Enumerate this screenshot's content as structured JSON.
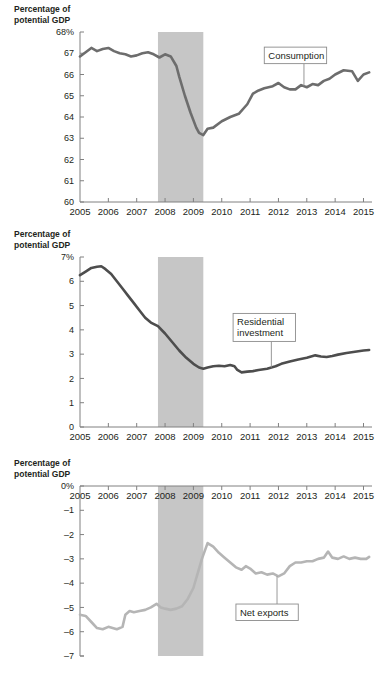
{
  "page": {
    "clipped_header": "Percentage of",
    "background": "#ffffff"
  },
  "colors": {
    "line_dark": "#6d6d6d",
    "line_light": "#b5b5b5",
    "recession_band": "#c6c6c6",
    "axis": "#808080",
    "text": "#231f20",
    "callout_border": "#8c8c8c"
  },
  "chart_data": [
    {
      "type": "line",
      "title": "",
      "id": "consumption",
      "ylabel": "Percentage of potential GDP",
      "xlabel": "",
      "legend_position": "inline-callout",
      "grid": false,
      "annotations": [
        {
          "label": "Consumption",
          "x": 2012.6,
          "y": 66.9,
          "anchor_x": 2012.9,
          "anchor_y": 65.45
        }
      ],
      "shaded_regions": [
        {
          "label": "recession",
          "x_start": 2007.75,
          "x_end": 2009.35
        }
      ],
      "xlim": [
        2005,
        2015.3
      ],
      "ylim": [
        60,
        68
      ],
      "ytick_labels": [
        "68%",
        "67",
        "66",
        "65",
        "64",
        "63",
        "62",
        "61",
        "60"
      ],
      "yticks": [
        68,
        67,
        66,
        65,
        64,
        63,
        62,
        61,
        60
      ],
      "xtick_labels": [
        "2005",
        "2006",
        "2007",
        "2008",
        "2009",
        "2010",
        "2011",
        "2012",
        "2013",
        "2014",
        "2015"
      ],
      "xticks": [
        2005,
        2006,
        2007,
        2008,
        2009,
        2010,
        2011,
        2012,
        2013,
        2014,
        2015
      ],
      "series": [
        {
          "name": "Consumption",
          "color": "#6d6d6d",
          "x": [
            2005.0,
            2005.2,
            2005.4,
            2005.6,
            2005.8,
            2006.0,
            2006.2,
            2006.4,
            2006.6,
            2006.8,
            2007.0,
            2007.2,
            2007.4,
            2007.6,
            2007.8,
            2008.0,
            2008.2,
            2008.4,
            2008.5,
            2008.7,
            2008.9,
            2009.1,
            2009.2,
            2009.35,
            2009.5,
            2009.7,
            2010.0,
            2010.3,
            2010.6,
            2010.9,
            2011.1,
            2011.3,
            2011.5,
            2011.8,
            2012.0,
            2012.2,
            2012.4,
            2012.6,
            2012.8,
            2013.0,
            2013.2,
            2013.4,
            2013.6,
            2013.8,
            2014.0,
            2014.3,
            2014.6,
            2014.8,
            2015.0,
            2015.2
          ],
          "y": [
            66.85,
            67.05,
            67.25,
            67.1,
            67.2,
            67.25,
            67.1,
            67.0,
            66.95,
            66.85,
            66.9,
            67.0,
            67.05,
            66.95,
            66.8,
            66.95,
            66.85,
            66.4,
            65.9,
            65.0,
            64.2,
            63.5,
            63.25,
            63.15,
            63.45,
            63.5,
            63.8,
            64.0,
            64.15,
            64.6,
            65.1,
            65.25,
            65.35,
            65.45,
            65.6,
            65.4,
            65.3,
            65.3,
            65.5,
            65.4,
            65.55,
            65.5,
            65.7,
            65.8,
            66.0,
            66.2,
            66.15,
            65.7,
            66.0,
            66.1
          ]
        }
      ]
    },
    {
      "type": "line",
      "title": "",
      "id": "residential-investment",
      "ylabel": "Percentage of potential GDP",
      "xlabel": "",
      "legend_position": "inline-callout",
      "grid": false,
      "annotations": [
        {
          "label": "Residential\ninvestment",
          "label_line1": "Residential",
          "label_line2": "investment",
          "x": 2011.5,
          "y": 4.1,
          "anchor_x": 2011.75,
          "anchor_y": 2.45
        }
      ],
      "shaded_regions": [
        {
          "label": "recession",
          "x_start": 2007.75,
          "x_end": 2009.35
        }
      ],
      "xlim": [
        2005,
        2015.3
      ],
      "ylim": [
        0,
        7
      ],
      "ytick_labels": [
        "7%",
        "6",
        "5",
        "4",
        "3",
        "2",
        "1",
        "0"
      ],
      "yticks": [
        7,
        6,
        5,
        4,
        3,
        2,
        1,
        0
      ],
      "xtick_labels": [
        "2005",
        "2006",
        "2007",
        "2008",
        "2009",
        "2010",
        "2011",
        "2012",
        "2013",
        "2014",
        "2015"
      ],
      "xticks": [
        2005,
        2006,
        2007,
        2008,
        2009,
        2010,
        2011,
        2012,
        2013,
        2014,
        2015
      ],
      "series": [
        {
          "name": "Residential investment",
          "color": "#4d4d4d",
          "x": [
            2005.0,
            2005.2,
            2005.4,
            2005.6,
            2005.75,
            2005.9,
            2006.1,
            2006.3,
            2006.5,
            2006.7,
            2006.9,
            2007.1,
            2007.3,
            2007.5,
            2007.75,
            2008.0,
            2008.25,
            2008.5,
            2008.75,
            2009.0,
            2009.2,
            2009.35,
            2009.5,
            2009.7,
            2009.9,
            2010.1,
            2010.3,
            2010.45,
            2010.55,
            2010.7,
            2010.9,
            2011.1,
            2011.3,
            2011.6,
            2011.9,
            2012.1,
            2012.4,
            2012.7,
            2013.0,
            2013.3,
            2013.5,
            2013.7,
            2013.9,
            2014.1,
            2014.4,
            2014.7,
            2015.0,
            2015.2
          ],
          "y": [
            6.25,
            6.4,
            6.55,
            6.6,
            6.62,
            6.5,
            6.3,
            6.0,
            5.7,
            5.4,
            5.1,
            4.8,
            4.5,
            4.3,
            4.15,
            3.85,
            3.5,
            3.15,
            2.85,
            2.6,
            2.45,
            2.4,
            2.45,
            2.5,
            2.52,
            2.5,
            2.55,
            2.5,
            2.35,
            2.25,
            2.28,
            2.3,
            2.35,
            2.4,
            2.5,
            2.6,
            2.7,
            2.78,
            2.85,
            2.95,
            2.9,
            2.88,
            2.92,
            2.98,
            3.05,
            3.1,
            3.15,
            3.17
          ]
        }
      ]
    },
    {
      "type": "line",
      "title": "",
      "id": "net-exports",
      "ylabel": "Percentage of potential GDP",
      "xlabel": "",
      "legend_position": "inline-callout",
      "grid": false,
      "annotations": [
        {
          "label": "Net exports",
          "x": 2011.6,
          "y": -5.2,
          "anchor_x": 2011.95,
          "anchor_y": -3.72
        }
      ],
      "shaded_regions": [
        {
          "label": "recession",
          "x_start": 2007.75,
          "x_end": 2009.35
        }
      ],
      "xlim": [
        2005,
        2015.3
      ],
      "ylim": [
        -7,
        0
      ],
      "ytick_labels": [
        "0%",
        "–1",
        "–2",
        "–3",
        "–4",
        "–5",
        "–6",
        "–7"
      ],
      "yticks": [
        0,
        -1,
        -2,
        -3,
        -4,
        -5,
        -6,
        -7
      ],
      "xtick_labels": [
        "2005",
        "2006",
        "2007",
        "2008",
        "2009",
        "2010",
        "2011",
        "2012",
        "2013",
        "2014",
        "2015"
      ],
      "xticks": [
        2005,
        2006,
        2007,
        2008,
        2009,
        2010,
        2011,
        2012,
        2013,
        2014,
        2015
      ],
      "series": [
        {
          "name": "Net exports",
          "color": "#b5b5b5",
          "x": [
            2005.0,
            2005.2,
            2005.4,
            2005.6,
            2005.8,
            2006.0,
            2006.15,
            2006.3,
            2006.5,
            2006.6,
            2006.75,
            2006.9,
            2007.1,
            2007.3,
            2007.5,
            2007.7,
            2007.85,
            2008.0,
            2008.2,
            2008.4,
            2008.6,
            2008.8,
            2009.0,
            2009.15,
            2009.3,
            2009.5,
            2009.7,
            2009.9,
            2010.1,
            2010.3,
            2010.5,
            2010.7,
            2010.85,
            2011.0,
            2011.2,
            2011.4,
            2011.6,
            2011.8,
            2012.0,
            2012.2,
            2012.4,
            2012.6,
            2012.8,
            2013.0,
            2013.2,
            2013.4,
            2013.6,
            2013.75,
            2013.9,
            2014.1,
            2014.3,
            2014.5,
            2014.7,
            2014.9,
            2015.1,
            2015.2
          ],
          "y": [
            -5.3,
            -5.35,
            -5.6,
            -5.85,
            -5.9,
            -5.8,
            -5.85,
            -5.9,
            -5.8,
            -5.3,
            -5.15,
            -5.2,
            -5.15,
            -5.1,
            -5.0,
            -4.85,
            -5.0,
            -5.05,
            -5.1,
            -5.05,
            -4.95,
            -4.65,
            -4.2,
            -3.6,
            -3.0,
            -2.35,
            -2.5,
            -2.75,
            -2.95,
            -3.15,
            -3.35,
            -3.45,
            -3.3,
            -3.4,
            -3.6,
            -3.55,
            -3.65,
            -3.6,
            -3.72,
            -3.6,
            -3.3,
            -3.15,
            -3.15,
            -3.1,
            -3.1,
            -3.0,
            -2.95,
            -2.7,
            -2.95,
            -3.0,
            -2.9,
            -3.0,
            -2.95,
            -3.0,
            -3.0,
            -2.92
          ]
        }
      ]
    }
  ]
}
